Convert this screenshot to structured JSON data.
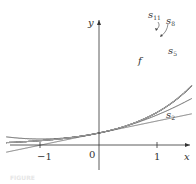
{
  "chart_data": {
    "type": "line",
    "title": "",
    "xlabel": "x",
    "ylabel": "y",
    "x_ticks": [
      "-1",
      "0",
      "1"
    ],
    "xlim": [
      -1.15,
      1.35
    ],
    "ylim": [
      -1.5,
      11
    ],
    "grid": false,
    "legend": "inline labels",
    "series": [
      {
        "name": "f",
        "label": "f",
        "expression": "e^x",
        "color": "#222222"
      },
      {
        "name": "s2",
        "label": "s₂",
        "degree": 2,
        "color": "#333333"
      },
      {
        "name": "s5",
        "label": "s₅",
        "degree": 5,
        "color": "#555555"
      },
      {
        "name": "s8",
        "label": "s₈",
        "degree": 8,
        "color": "#777777"
      },
      {
        "name": "s11",
        "label": "s₁₁",
        "degree": 11,
        "color": "#999999"
      },
      {
        "name": "s_odd_low",
        "label": "",
        "degree": 1,
        "color": "#555555"
      },
      {
        "name": "s_even_high",
        "label": "",
        "degree": 10,
        "color": "#bbbbbb"
      }
    ],
    "annotations": [
      "f",
      "s11",
      "s8",
      "s5",
      "s2"
    ]
  },
  "labels": {
    "y_axis": "y",
    "x_axis": "x",
    "origin": "0",
    "x_neg_one": "−1",
    "x_one": "1",
    "f": "f",
    "s2": "s",
    "s2_sub": "2",
    "s5": "s",
    "s5_sub": "5",
    "s8": "s",
    "s8_sub": "8",
    "s11": "s",
    "s11_sub": "11",
    "caption": "FIGURE"
  }
}
